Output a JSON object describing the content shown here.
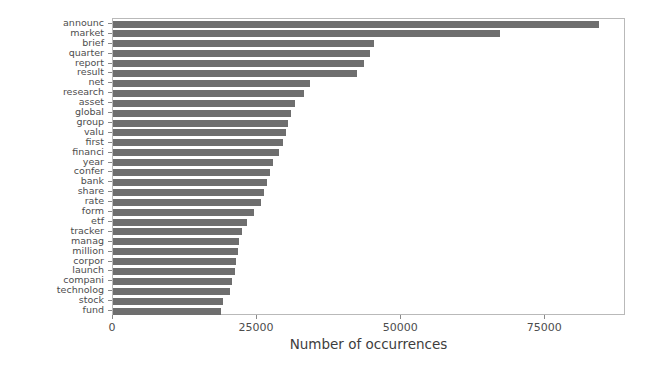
{
  "chart_data": {
    "type": "bar",
    "orientation": "horizontal",
    "title": "",
    "subtitle": "",
    "xlabel": "Number of occurrences",
    "ylabel": "",
    "xlim": [
      0,
      89000
    ],
    "ylim": null,
    "grid": false,
    "legend": null,
    "xticks": [
      0,
      25000,
      50000,
      75000
    ],
    "xticklabels": [
      "0",
      "25000",
      "50000",
      "75000"
    ],
    "bar_color": "#6e6e6e",
    "frame_color": "#b9b9b9",
    "categories": [
      "announc",
      "market",
      "brief",
      "quarter",
      "report",
      "result",
      "net",
      "research",
      "asset",
      "global",
      "group",
      "valu",
      "first",
      "financi",
      "year",
      "confer",
      "bank",
      "share",
      "rate",
      "form",
      "etf",
      "tracker",
      "manag",
      "million",
      "corpor",
      "launch",
      "compani",
      "technolog",
      "stock",
      "fund"
    ],
    "values": [
      84300,
      67200,
      45300,
      44600,
      43500,
      42300,
      34100,
      33100,
      31600,
      30900,
      30400,
      30000,
      29500,
      28800,
      27800,
      27200,
      26700,
      26200,
      25700,
      24400,
      23300,
      22300,
      21900,
      21600,
      21400,
      21200,
      20600,
      20300,
      19100,
      18800
    ],
    "annotations": []
  },
  "axis": {
    "x_title": "Number of occurrences"
  }
}
